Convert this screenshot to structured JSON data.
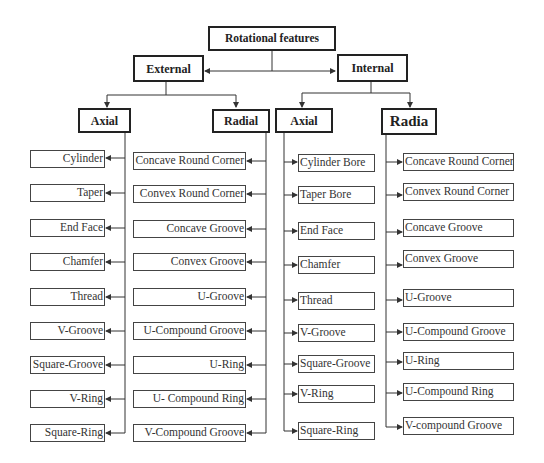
{
  "root": {
    "label": "Rotational features"
  },
  "external": {
    "label": "External",
    "axial": {
      "label": "Axial",
      "items": [
        "Cylinder",
        "Taper",
        "End Face",
        "Chamfer",
        "Thread",
        "V-Groove",
        "Square-Groove",
        "V-Ring",
        "Square-Ring"
      ]
    },
    "radial": {
      "label": "Radial",
      "items": [
        "Concave Round Corner",
        "Convex Round Corner",
        "Concave Groove",
        "Convex Groove",
        "U-Groove",
        "U-Compound Groove",
        "U-Ring",
        "U- Compound Ring",
        "V-Compound Groove"
      ]
    }
  },
  "internal": {
    "label": "Internal",
    "axial": {
      "label": "Axial",
      "items": [
        "Cylinder Bore",
        "Taper Bore",
        "End Face",
        "Chamfer",
        "Thread",
        "V-Groove",
        "Square-Groove",
        "V-Ring",
        "Square-Ring"
      ]
    },
    "radial": {
      "label": "Radia",
      "items": [
        "Concave Round Corner",
        "Convex Round Corner",
        "Concave Groove",
        "Convex Groove",
        "U-Groove",
        "U-Compound Groove",
        "U-Ring",
        "U-Compound Ring",
        "V-compound Groove"
      ]
    }
  },
  "colors": {
    "line": "#333333",
    "box_border": "#444444",
    "text": "#333333"
  }
}
